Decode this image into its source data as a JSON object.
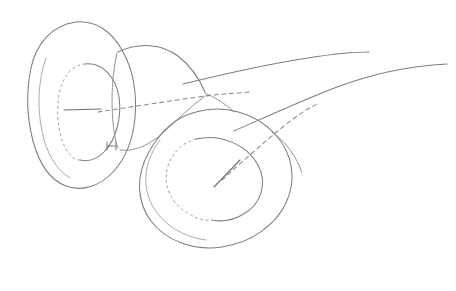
{
  "figure": {
    "style": "hand-drawn pencil line drawing",
    "background_color": "#ffffff",
    "line_color": "#7d7d83",
    "hidden_line_color": "#8a8a90",
    "width": 456,
    "height": 291,
    "labels": [],
    "annotations": []
  },
  "chart_data": {
    "type": "diagram",
    "elements": [
      {
        "name": "left-funnel",
        "kind": "funnel-mouth",
        "outer_rim_center": [
          86,
          105
        ],
        "outer_rim_rx": 56,
        "outer_rim_ry": 83,
        "inner_rim_center": [
          90,
          112
        ],
        "inner_rim_rx": 31,
        "inner_rim_ry": 48,
        "tilt_deg": -8
      },
      {
        "name": "right-funnel",
        "kind": "funnel-mouth",
        "outer_rim_center": [
          218,
          176
        ],
        "outer_rim_rx": 78,
        "outer_rim_ry": 58,
        "inner_rim_center": [
          222,
          172
        ],
        "inner_rim_rx": 48,
        "inner_rim_ry": 33,
        "tilt_deg": -33
      },
      {
        "name": "throat",
        "kind": "connecting-tube",
        "from": [
          120,
          60
        ],
        "to": [
          245,
          110
        ]
      },
      {
        "name": "sheet-curve-upper",
        "kind": "open-curve",
        "start": [
          185,
          83
        ],
        "end": [
          368,
          53
        ]
      },
      {
        "name": "sheet-curve-lower",
        "kind": "open-curve",
        "start": [
          236,
          132
        ],
        "end": [
          446,
          66
        ]
      },
      {
        "name": "left-axis-dash",
        "kind": "hidden-axis",
        "start": [
          89,
          115
        ],
        "end": [
          249,
          93
        ]
      },
      {
        "name": "right-axis-dash",
        "kind": "hidden-axis",
        "start": [
          218,
          180
        ],
        "end": [
          318,
          106
        ]
      }
    ],
    "grid": false,
    "legend": null,
    "xlabel": "",
    "ylabel": ""
  }
}
